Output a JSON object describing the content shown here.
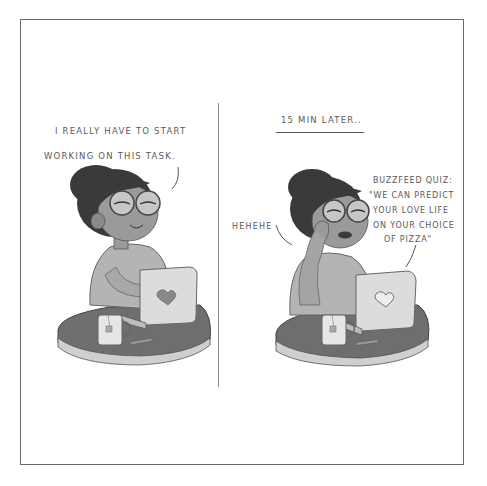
{
  "comic": {
    "panels": [
      {
        "id": "left",
        "speech": [
          "I REALLY HAVE TO START",
          "WORKING ON THIS TASK."
        ]
      },
      {
        "id": "right",
        "caption": "15 MIN LATER..",
        "laugh": "HEHEHE",
        "speech": [
          "BUZZFEED QUIZ:",
          "\"WE CAN PREDICT",
          "YOUR LOVE LIFE",
          "ON YOUR CHOICE",
          "OF PIZZA\""
        ]
      }
    ],
    "colors": {
      "border": "#6a6a6a",
      "text": "#5a5a5a",
      "hair": "#3a3a3a",
      "skin": "#9a9a9a",
      "shirt": "#b4b4b4",
      "laptop": "#dcdcdc",
      "table": "#6e6e6e"
    }
  }
}
